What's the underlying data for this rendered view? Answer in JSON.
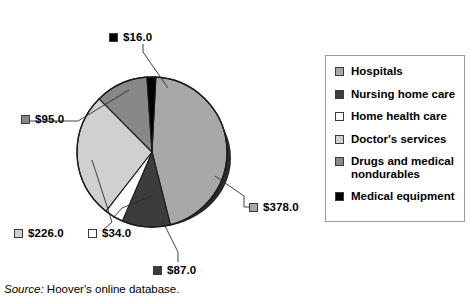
{
  "chart_data": {
    "type": "pie",
    "title": "",
    "subtitle": "",
    "xlabel": "",
    "ylabel": "",
    "grid": false,
    "legend_position": "right",
    "value_prefix": "$",
    "total": 836.0,
    "units": "billions of dollars",
    "categories": [
      "Hospitals",
      "Nursing home care",
      "Home health care",
      "Doctor's services",
      "Drugs and medical nondurables",
      "Medical equipment"
    ],
    "values": [
      378.0,
      87.0,
      34.0,
      226.0,
      95.0,
      16.0
    ],
    "value_labels": [
      "$378.0",
      "$87.0",
      "$34.0",
      "$226.0",
      "$95.0",
      "$16.0"
    ],
    "colors": [
      "#a8a8a8",
      "#3c3c3c",
      "#ffffff",
      "#d0d0d0",
      "#888888",
      "#000000"
    ],
    "slices": [
      {
        "label": "Hospitals",
        "value": 378.0,
        "value_label": "$378.0",
        "color": "#a8a8a8",
        "start_angle": 3.0,
        "sweep_angle": 162.8
      },
      {
        "label": "Nursing home care",
        "value": 87.0,
        "value_label": "$87.0",
        "color": "#3c3c3c",
        "start_angle": 165.8,
        "sweep_angle": 37.5
      },
      {
        "label": "Home health care",
        "value": 34.0,
        "value_label": "$34.0",
        "color": "#ffffff",
        "start_angle": 203.3,
        "sweep_angle": 14.6
      },
      {
        "label": "Doctor's services",
        "value": 226.0,
        "value_label": "$226.0",
        "color": "#d0d0d0",
        "start_angle": 217.9,
        "sweep_angle": 97.3
      },
      {
        "label": "Drugs and medical nondurables",
        "value": 95.0,
        "value_label": "$95.0",
        "color": "#888888",
        "start_angle": 315.2,
        "sweep_angle": 40.9
      },
      {
        "label": "Medical equipment",
        "value": 16.0,
        "value_label": "$16.0",
        "color": "#000000",
        "start_angle": 356.1,
        "sweep_angle": 6.9
      }
    ]
  },
  "labels": {
    "medical_equipment": {
      "text": "$16.0",
      "swatch": "#000000"
    },
    "drugs": {
      "text": "$95.0",
      "swatch": "#888888"
    },
    "doctors": {
      "text": "$226.0",
      "swatch": "#d0d0d0"
    },
    "home_health": {
      "text": "$34.0",
      "swatch": "#ffffff"
    },
    "nursing": {
      "text": "$87.0",
      "swatch": "#3c3c3c"
    },
    "hospitals": {
      "text": "$378.0",
      "swatch": "#a8a8a8"
    }
  },
  "legend": {
    "items": [
      {
        "label": "Hospitals",
        "color": "#a8a8a8"
      },
      {
        "label": "Nursing home care",
        "color": "#3c3c3c"
      },
      {
        "label": "Home health care",
        "color": "#ffffff"
      },
      {
        "label": "Doctor's services",
        "color": "#d0d0d0"
      },
      {
        "label": "Drugs and medical\nnondurables",
        "color": "#888888"
      },
      {
        "label": "Medical equipment",
        "color": "#000000"
      }
    ]
  },
  "source": {
    "keyword": "Source:",
    "text": "Hoover's online database."
  }
}
